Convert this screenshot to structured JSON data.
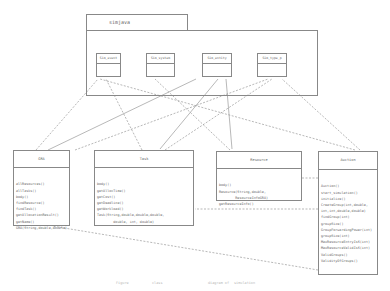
{
  "package": {
    "name": "simjava",
    "classes": [
      "Sim_event",
      "Sim_system",
      "Sim_entity",
      "Sim_type_p"
    ]
  },
  "classes": [
    {
      "name": "GRA",
      "operations": [
        "allResources()",
        "allTasks()",
        "body()",
        "findResource()",
        "findTask()",
        "getAllocationResult()",
        "getName()",
        "GRA(String,double,double)"
      ]
    },
    {
      "name": "Task",
      "operations": [
        "body()",
        "getAllocTime()",
        "getCost()",
        "getDeadline()",
        "getWorkload()",
        "Task(String,double,double,double,",
        "        double, int, double)"
      ]
    },
    {
      "name": "Resource",
      "operations": [
        "body()",
        "Resource(String,double,",
        "        ResourceInfoGRA)",
        "getResourceInfo()"
      ]
    },
    {
      "name": "Auction",
      "operations": [
        "Auction()",
        "start_simulation()",
        "initialize()",
        "CreateGroup(int,double,",
        "int,int,double,double)",
        "findGroup(int)",
        "groupSize()",
        "GroupForwardingPower(int)",
        "groupSize(int)",
        "MaxResourceEntryIsS(int)",
        "MaxResourceValidIsS(int)",
        "ValidGroups()",
        "ValidityOfGroups()"
      ]
    }
  ],
  "caption": [
    "Figure",
    "class",
    "diagram of",
    "simulation"
  ]
}
